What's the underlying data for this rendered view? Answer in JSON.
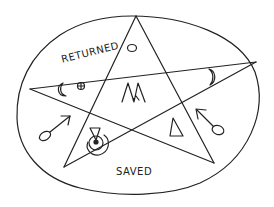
{
  "figure": {
    "labels": {
      "returned": "RETURNED",
      "saved": "SAVED"
    },
    "shapes": {
      "outer": "ellipse",
      "inner": "pentagram"
    },
    "symbols": [
      {
        "name": "circle",
        "position": "top-point"
      },
      {
        "name": "crescent-moon-left",
        "position": "left-point"
      },
      {
        "name": "earth-symbol",
        "position": "left-point"
      },
      {
        "name": "crescent-moon-right",
        "position": "right-point"
      },
      {
        "name": "mars-symbol",
        "position": "bottom-left-outside"
      },
      {
        "name": "mercury-like-symbol",
        "position": "bottom-left-point"
      },
      {
        "name": "triangle",
        "position": "bottom-right-point"
      },
      {
        "name": "mars-symbol-reversed",
        "position": "bottom-right-outside"
      },
      {
        "name": "m-glyph",
        "position": "center"
      }
    ],
    "stroke_color": "#222222",
    "background_color": "#ffffff"
  }
}
